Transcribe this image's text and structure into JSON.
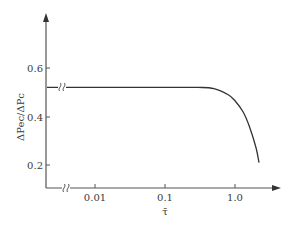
{
  "chart_data": {
    "type": "line",
    "title": "",
    "xlabel": "τ̄",
    "ylabel": "ΔPec/ΔPc",
    "xscale": "log",
    "x_ticks": [
      {
        "value": 0.01,
        "label": "0.01"
      },
      {
        "value": 0.1,
        "label": "0.1"
      },
      {
        "value": 1.0,
        "label": "1.0"
      }
    ],
    "y_ticks": [
      {
        "value": 0.2,
        "label": "0.2"
      },
      {
        "value": 0.4,
        "label": "0.4"
      },
      {
        "value": 0.6,
        "label": "0.6"
      }
    ],
    "ylim": [
      0.11,
      0.82
    ],
    "xlim": [
      0.0025,
      6.0
    ],
    "axis_breaks": [
      "x-axis near origin",
      "y-axis near origin (series line)"
    ],
    "grid": false,
    "legend": null,
    "series": [
      {
        "name": "ΔPec/ΔPc",
        "x": [
          0.003,
          0.01,
          0.05,
          0.1,
          0.3,
          0.5,
          0.8,
          1.0,
          1.3,
          1.6,
          2.0,
          2.2
        ],
        "y": [
          0.52,
          0.52,
          0.52,
          0.52,
          0.52,
          0.515,
          0.49,
          0.465,
          0.42,
          0.36,
          0.27,
          0.21
        ]
      }
    ],
    "colors": {
      "line": "#333333",
      "axis": "#555555",
      "text": "#3a3a3a"
    }
  },
  "labels": {
    "xlabel": "τ̄",
    "ylabel": "ΔPec/ΔPc",
    "xt0": "0.01",
    "xt1": "0.1",
    "xt2": "1.0",
    "yt0": "0.2",
    "yt1": "0.4",
    "yt2": "0.6"
  }
}
